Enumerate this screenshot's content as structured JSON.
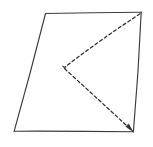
{
  "figure": {
    "canvas": {
      "width": 153,
      "height": 147,
      "background": "#ffffff"
    },
    "style": {
      "solid_color": "#3c3c3c",
      "dashed_color": "#2e2e2e",
      "solid_width": 1.15,
      "dashed_width": 1.25,
      "dash_pattern": "3.1 2.6"
    },
    "vertices": {
      "top_left": {
        "label": "top-left corner",
        "x": 45,
        "y": 13
      },
      "top_right": {
        "label": "top-right corner",
        "x": 141,
        "y": 12
      },
      "bottom_right": {
        "label": "bottom-right corner",
        "x": 133,
        "y": 132
      },
      "bottom_left": {
        "label": "bottom-left corner",
        "x": 14,
        "y": 131
      },
      "chevron_apex": {
        "label": "dashed chevron apex",
        "x": 64,
        "y": 68
      }
    },
    "shapes": {
      "quadrilateral": {
        "name": "outer quadrilateral",
        "stroke": "solid",
        "path": "M 45.5 13.5 L 141.2 12.2 L 133.4 131.8 L 14.2 131.2 Z"
      },
      "quad_edges": [
        {
          "name": "top-edge",
          "path": "M 45.5 13.5 Q 93 12.4 141.2 12.2"
        },
        {
          "name": "right-edge",
          "path": "M 141.2 12.2 Q 138.6 72 133.4 131.8"
        },
        {
          "name": "bottom-edge",
          "path": "M 133.4 131.8 Q 74 131.0 14.2 131.2"
        },
        {
          "name": "left-edge",
          "path": "M 14.2 131.2 Q 30.8 72 45.5 13.5"
        }
      ],
      "chevron_upper": {
        "name": "dashed segment top-right to apex",
        "stroke": "dashed",
        "path": "M 140.0 13.8 Q 100 40 64.8 67.2"
      },
      "chevron_lower": {
        "name": "dashed segment apex to bottom-right",
        "stroke": "dashed",
        "path": "M 64.5 68.6 Q 99 100 131.6 130.2"
      },
      "arrow_head": {
        "name": "arrowhead at bottom-right",
        "path": "M 133.2 131.8 L 125.8 126.6 L 128.6 124.0 Z"
      },
      "apex_tick": {
        "name": "apex pen-mark",
        "path": "M 62.8 66.2 L 65.4 68.2"
      }
    }
  }
}
